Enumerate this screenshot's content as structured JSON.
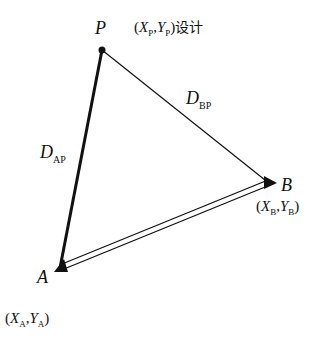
{
  "diagram": {
    "type": "triangle-survey",
    "points": {
      "P": {
        "label": "P",
        "coord_x": "X",
        "coord_y": "Y",
        "sub": "P",
        "suffix": "设计",
        "marker": "dot"
      },
      "A": {
        "label": "A",
        "coord_x": "X",
        "coord_y": "Y",
        "sub": "A",
        "marker": "filled-triangle"
      },
      "B": {
        "label": "B",
        "coord_x": "X",
        "coord_y": "Y",
        "sub": "B",
        "marker": "filled-triangle"
      }
    },
    "edges": {
      "AP": {
        "label": "D",
        "sub": "AP",
        "style": "thick-solid"
      },
      "BP": {
        "label": "D",
        "sub": "BP",
        "style": "thin-solid"
      },
      "AB": {
        "style": "double-line"
      }
    },
    "punct": {
      "open": "(",
      "comma": ",",
      "close": ")"
    },
    "colors": {
      "line": "#111111",
      "background": "#ffffff"
    }
  }
}
